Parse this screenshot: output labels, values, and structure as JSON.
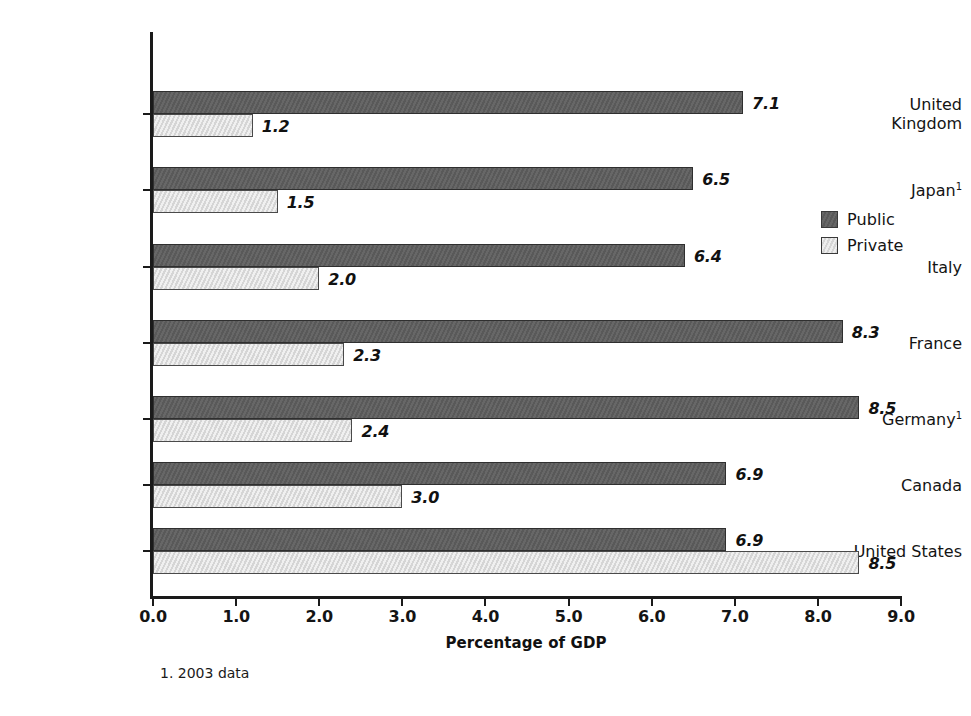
{
  "chart_data": {
    "type": "bar",
    "orientation": "horizontal",
    "title": "",
    "xlabel": "Percentage of GDP",
    "ylabel": "",
    "xlim": [
      0.0,
      9.0
    ],
    "xticks": [
      "0.0",
      "1.0",
      "2.0",
      "3.0",
      "4.0",
      "5.0",
      "6.0",
      "7.0",
      "8.0",
      "9.0"
    ],
    "grid": false,
    "legend_position": "right-middle",
    "categories": [
      "United Kingdom",
      "Japan",
      "Italy",
      "France",
      "Germany",
      "Canada",
      "United States"
    ],
    "category_lines": [
      [
        "United",
        "Kingdom"
      ],
      [
        "Japan"
      ],
      [
        "Italy"
      ],
      [
        "France"
      ],
      [
        "Germany"
      ],
      [
        "Canada"
      ],
      [
        "United States"
      ]
    ],
    "category_footnote_marks": [
      "",
      "1",
      "",
      "",
      "1",
      "",
      ""
    ],
    "series": [
      {
        "name": "Public",
        "color": "#5e5e5e",
        "values": [
          7.1,
          6.5,
          6.4,
          8.3,
          8.5,
          6.9,
          6.9
        ],
        "labels": [
          "7.1",
          "6.5",
          "6.4",
          "8.3",
          "8.5",
          "6.9",
          "6.9"
        ]
      },
      {
        "name": "Private",
        "color": "#dddddd",
        "values": [
          1.2,
          1.5,
          2.0,
          2.3,
          2.4,
          3.0,
          8.5
        ],
        "labels": [
          "1.2",
          "1.5",
          "2.0",
          "2.3",
          "2.4",
          "3.0",
          "8.5"
        ]
      }
    ],
    "footnote": "1. 2003 data"
  },
  "legend": {
    "items": [
      {
        "label": "Public",
        "key": "public"
      },
      {
        "label": "Private",
        "key": "private"
      }
    ]
  },
  "colors": {
    "public": "#5e5e5e",
    "private": "#dddddd",
    "axis": "#1a1a1a",
    "text": "#141414",
    "background": "#ffffff"
  }
}
